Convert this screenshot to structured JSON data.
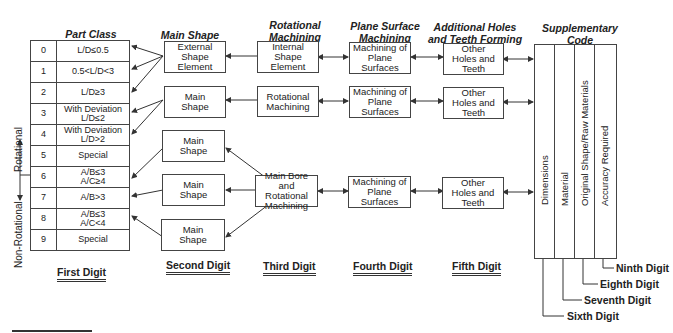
{
  "headers": {
    "part_class": "Part Class",
    "main_shape": "Main Shape",
    "rotational_machining": "Rotational\nMachining",
    "plane_surface_machining": "Plane Surface\nMachining",
    "additional_holes": "Additional Holes\nand Teeth Forming",
    "supplementary_code": "Supplementary\nCode"
  },
  "part_class": {
    "rows": [
      {
        "digit": "0",
        "label": "L/D≤0.5"
      },
      {
        "digit": "1",
        "label": "0.5<L/D<3"
      },
      {
        "digit": "2",
        "label": "L/D≥3"
      },
      {
        "digit": "3",
        "label": "With Deviation\nL/D≤2"
      },
      {
        "digit": "4",
        "label": "With Deviation\nL/D>2"
      },
      {
        "digit": "5",
        "label": "Special"
      },
      {
        "digit": "6",
        "label": "A/B≤3\nA/C≥4"
      },
      {
        "digit": "7",
        "label": "A/B>3"
      },
      {
        "digit": "8",
        "label": "A/B≤3\nA/C<4"
      },
      {
        "digit": "9",
        "label": "Special"
      }
    ],
    "side_labels": {
      "rotational": "Rotational",
      "non_rotational": "Non-Rotational"
    }
  },
  "second_digit_boxes": [
    "External\nShape\nElement",
    "Main\nShape",
    "Main\nShape",
    "Main\nShape",
    "Main\nShape"
  ],
  "third_digit_boxes": [
    "Internal\nShape\nElement",
    "Rotational\nMachining",
    "Main Bore and\nRotational\nMachining"
  ],
  "fourth_digit_boxes": [
    "Machining of\nPlane\nSurfaces",
    "Machining of\nPlane\nSurfaces",
    "Machining of\nPlane\nSurfaces"
  ],
  "fifth_digit_boxes": [
    "Other\nHoles and\nTeeth",
    "Other\nHoles and\nTeeth",
    "Other\nHoles and\nTeeth"
  ],
  "supplementary_columns": [
    "Dimensions",
    "Material",
    "Original Shape/Raw Materials",
    "Accuracy Required"
  ],
  "digit_labels": {
    "first": "First Digit",
    "second": "Second Digit",
    "third": "Third Digit",
    "fourth": "Fourth Digit",
    "fifth": "Fifth Digit",
    "sixth": "Sixth Digit",
    "seventh": "Seventh Digit",
    "eighth": "Eighth Digit",
    "ninth": "Ninth Digit"
  }
}
